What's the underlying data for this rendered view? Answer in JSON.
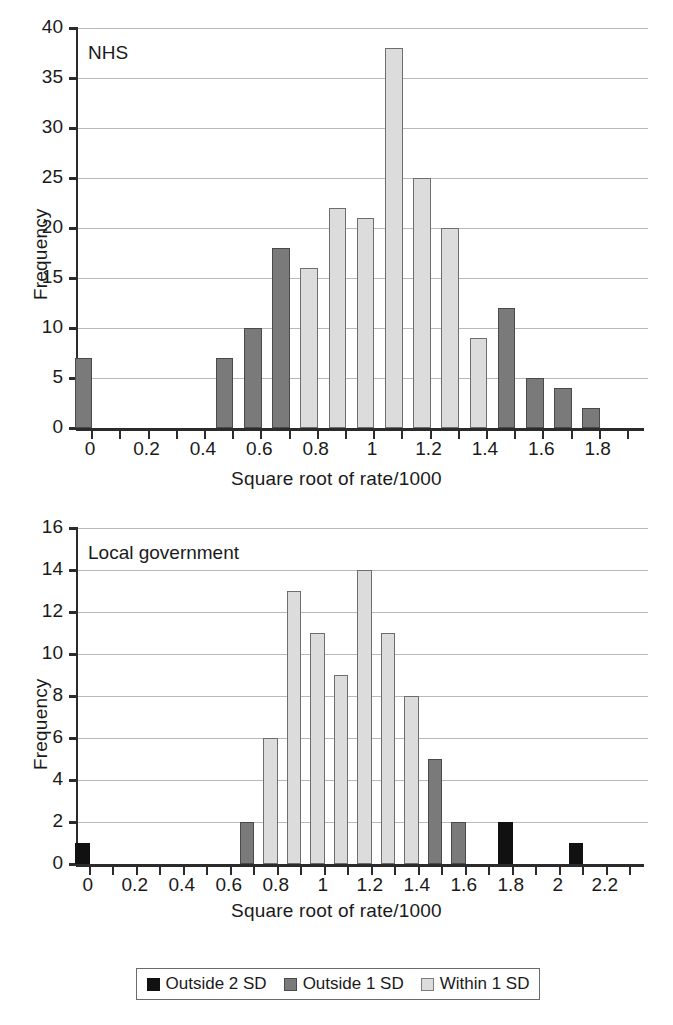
{
  "legend": {
    "items": [
      {
        "key": "out2",
        "label": "Outside 2 SD",
        "color": "#111111"
      },
      {
        "key": "out1",
        "label": "Outside 1 SD",
        "color": "#7a7a7a"
      },
      {
        "key": "within",
        "label": "Within 1 SD",
        "color": "#dcdcdc"
      }
    ]
  },
  "chart_data": [
    {
      "id": "nhs",
      "type": "bar",
      "title": "NHS",
      "xlabel": "Square root of rate/1000",
      "ylabel": "Frequency",
      "ylim": [
        0,
        40
      ],
      "ytick_step": 5,
      "yticks": [
        "0",
        "5",
        "10",
        "15",
        "20",
        "25",
        "30",
        "35",
        "40"
      ],
      "xlim": [
        -0.05,
        1.95
      ],
      "xtick_step": 0.1,
      "xticks": [
        0,
        0.1,
        0.2,
        0.3,
        0.4,
        0.5,
        0.6,
        0.7,
        0.8,
        0.9,
        1.0,
        1.1,
        1.2,
        1.3,
        1.4,
        1.5,
        1.6,
        1.7,
        1.8,
        1.9
      ],
      "xtick_labels": [
        "0",
        "",
        "0.2",
        "",
        "0.4",
        "",
        "0.6",
        "",
        "0.8",
        "",
        "1",
        "",
        "1.2",
        "",
        "1.4",
        "",
        "1.6",
        "",
        "1.8",
        ""
      ],
      "grid": true,
      "bin_width": 0.1,
      "bars": [
        {
          "x": 0.0,
          "value": 7,
          "band": "out1"
        },
        {
          "x": 0.5,
          "value": 7,
          "band": "out1"
        },
        {
          "x": 0.6,
          "value": 10,
          "band": "out1"
        },
        {
          "x": 0.7,
          "value": 18,
          "band": "out1"
        },
        {
          "x": 0.8,
          "value": 16,
          "band": "within"
        },
        {
          "x": 0.9,
          "value": 22,
          "band": "within"
        },
        {
          "x": 1.0,
          "value": 21,
          "band": "within"
        },
        {
          "x": 1.1,
          "value": 38,
          "band": "within"
        },
        {
          "x": 1.2,
          "value": 25,
          "band": "within"
        },
        {
          "x": 1.3,
          "value": 20,
          "band": "within"
        },
        {
          "x": 1.4,
          "value": 9,
          "band": "within"
        },
        {
          "x": 1.5,
          "value": 12,
          "band": "out1"
        },
        {
          "x": 1.6,
          "value": 5,
          "band": "out1"
        },
        {
          "x": 1.7,
          "value": 4,
          "band": "out1"
        },
        {
          "x": 1.8,
          "value": 2,
          "band": "out1"
        }
      ]
    },
    {
      "id": "local-government",
      "type": "bar",
      "title": "Local government",
      "xlabel": "Square root of rate/1000",
      "ylabel": "Frequency",
      "ylim": [
        0,
        16
      ],
      "ytick_step": 2,
      "yticks": [
        "0",
        "2",
        "4",
        "6",
        "8",
        "10",
        "12",
        "14",
        "16"
      ],
      "xlim": [
        -0.05,
        2.35
      ],
      "xtick_step": 0.1,
      "xticks": [
        0,
        0.1,
        0.2,
        0.3,
        0.4,
        0.5,
        0.6,
        0.7,
        0.8,
        0.9,
        1.0,
        1.1,
        1.2,
        1.3,
        1.4,
        1.5,
        1.6,
        1.7,
        1.8,
        1.9,
        2.0,
        2.1,
        2.2,
        2.3
      ],
      "xtick_labels": [
        "0",
        "",
        "0.2",
        "",
        "0.4",
        "",
        "0.6",
        "",
        "0.8",
        "",
        "1",
        "",
        "1.2",
        "",
        "1.4",
        "",
        "1.6",
        "",
        "1.8",
        "",
        "2",
        "",
        "2.2",
        ""
      ],
      "grid": true,
      "bin_width": 0.1,
      "bars": [
        {
          "x": 0.0,
          "value": 1,
          "band": "out2"
        },
        {
          "x": 0.7,
          "value": 2,
          "band": "out1"
        },
        {
          "x": 0.8,
          "value": 6,
          "band": "within"
        },
        {
          "x": 0.9,
          "value": 13,
          "band": "within"
        },
        {
          "x": 1.0,
          "value": 11,
          "band": "within"
        },
        {
          "x": 1.1,
          "value": 9,
          "band": "within"
        },
        {
          "x": 1.2,
          "value": 14,
          "band": "within"
        },
        {
          "x": 1.3,
          "value": 11,
          "band": "within"
        },
        {
          "x": 1.4,
          "value": 8,
          "band": "within"
        },
        {
          "x": 1.5,
          "value": 5,
          "band": "out1"
        },
        {
          "x": 1.6,
          "value": 2,
          "band": "out1"
        },
        {
          "x": 1.8,
          "value": 2,
          "band": "out2"
        },
        {
          "x": 2.1,
          "value": 1,
          "band": "out2"
        }
      ]
    }
  ]
}
